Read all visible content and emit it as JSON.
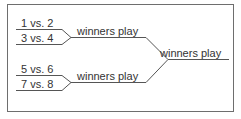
{
  "bracket": {
    "round1": [
      {
        "label": "1 vs. 2"
      },
      {
        "label": "3 vs. 4"
      },
      {
        "label": "5 vs. 6"
      },
      {
        "label": "7 vs. 8"
      }
    ],
    "round2": [
      {
        "label": "winners play"
      },
      {
        "label": "winners play"
      }
    ],
    "final": {
      "label": "winners play"
    }
  },
  "colors": {
    "line": "#555555",
    "border": "#6e6e6e",
    "text": "#333333"
  }
}
